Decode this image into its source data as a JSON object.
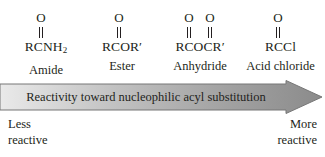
{
  "diagram": {
    "title": "Reactivity toward nucleophilic acyl substitution",
    "background_color": "#ffffff",
    "text_color": "#231f20"
  },
  "structures": [
    {
      "id": "amide",
      "formula_main": "RCNH",
      "formula_sub": "2",
      "formula_prime": "",
      "name": "Amide",
      "oxygens": [
        "O"
      ],
      "center_x": 46
    },
    {
      "id": "ester",
      "formula_main": "RCOR",
      "formula_sub": "",
      "formula_prime": "′",
      "name": "Ester",
      "oxygens": [
        "O"
      ],
      "center_x": 122
    },
    {
      "id": "anhydride",
      "formula_main": "RCOCR",
      "formula_sub": "",
      "formula_prime": "′",
      "name": "Anhydride",
      "oxygens": [
        "O",
        "O"
      ],
      "center_x": 199
    },
    {
      "id": "acid-chloride",
      "formula_main": "RCCl",
      "formula_sub": "",
      "formula_prime": "",
      "name": "Acid chloride",
      "oxygens": [
        "O"
      ],
      "center_x": 278
    }
  ],
  "arrow": {
    "label": "Reactivity toward nucleophilic acyl substitution",
    "direction": "right",
    "gradient_start_color": "#e8e8e8",
    "gradient_end_color": "#8e8e8e",
    "border_color": "#7a7a7a"
  },
  "captions": {
    "left": {
      "line1": "Less",
      "line2": "reactive"
    },
    "right": {
      "line1": "More",
      "line2": "reactive"
    }
  }
}
